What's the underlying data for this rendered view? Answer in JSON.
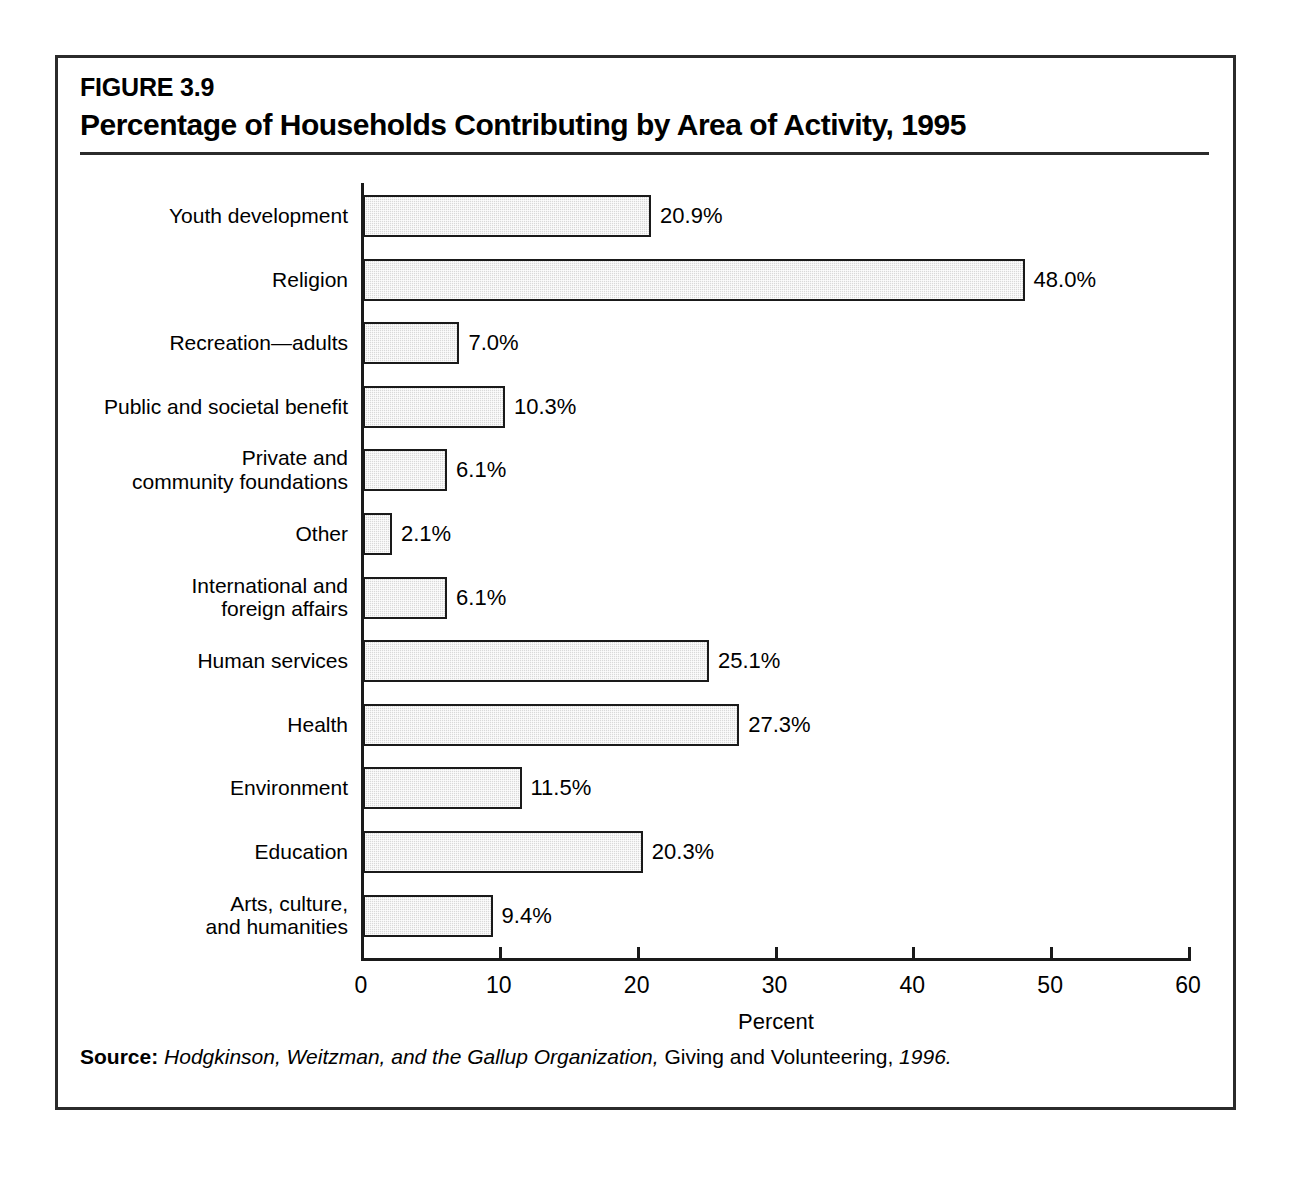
{
  "figure": {
    "number": "FIGURE 3.9",
    "title": "Percentage of Households Contributing by Area of Activity, 1995"
  },
  "source": {
    "label": "Source:",
    "authors": "Hodgkinson, Weitzman, and the Gallup Organization,",
    "publication": "Giving and Volunteering,",
    "year": "1996."
  },
  "chart_data": {
    "type": "bar",
    "orientation": "horizontal",
    "title": "Percentage of Households Contributing by Area of Activity, 1995",
    "xlabel": "Percent",
    "ylabel": "",
    "xlim": [
      0,
      60
    ],
    "xticks": [
      0,
      10,
      20,
      30,
      40,
      50,
      60
    ],
    "xtick_labels": [
      "0",
      "10",
      "20",
      "30",
      "40",
      "50",
      "60"
    ],
    "grid": false,
    "legend": null,
    "value_suffix": "%",
    "categories": [
      "Youth development",
      "Religion",
      "Recreation—adults",
      "Public and societal benefit",
      "Private and\ncommunity foundations",
      "Other",
      "International and\nforeign affairs",
      "Human services",
      "Health",
      "Environment",
      "Education",
      "Arts, culture,\nand humanities"
    ],
    "values": [
      20.9,
      48.0,
      7.0,
      10.3,
      6.1,
      2.1,
      6.1,
      25.1,
      27.3,
      11.5,
      20.3,
      9.4
    ],
    "value_labels": [
      "20.9%",
      "48.0%",
      "7.0%",
      "10.3%",
      "6.1%",
      "2.1%",
      "6.1%",
      "25.1%",
      "27.3%",
      "11.5%",
      "20.3%",
      "9.4%"
    ],
    "bar_fill_color": "#d9d9d9",
    "bar_border_color": "#1a1a1a",
    "axis_color": "#1a1a1a"
  }
}
